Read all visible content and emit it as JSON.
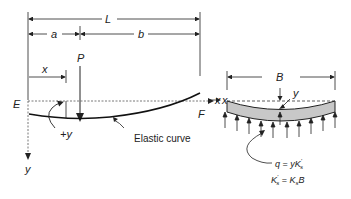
{
  "diagram": {
    "type": "beam-on-elastic-foundation",
    "left_figure": {
      "dimensions": {
        "total_length_label": "L",
        "left_segment_label": "a",
        "right_segment_label": "b",
        "position_label": "x"
      },
      "load_label": "P",
      "left_end_label": "E",
      "right_end_label": "F",
      "x_axis_label": "x",
      "y_axis_label": "y",
      "deflection_label": "+y",
      "curve_label": "Elastic curve"
    },
    "right_figure": {
      "width_label": "B",
      "deflection_label": "y",
      "x_axis_label": "x",
      "equation_1": "q = yK's",
      "equation_1_parts": {
        "q": "q",
        "eq": " = ",
        "y": "y",
        "K": "K",
        "sup": "'",
        "sub": "s"
      },
      "equation_2": "K's = KsB",
      "equation_2_parts": {
        "K1": "K",
        "sup1": "'",
        "sub1": "s",
        "eq": " = ",
        "K2": "K",
        "sub2": "s",
        "B": "B"
      },
      "colors": {
        "beam_fill": "#c8c8c8",
        "line": "#222222"
      }
    }
  }
}
